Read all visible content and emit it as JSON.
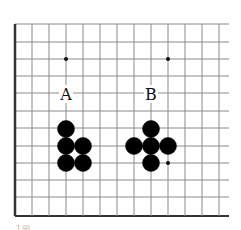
{
  "diagram": {
    "type": "go-board-fragment",
    "grid": {
      "columns_x": [
        15,
        32,
        49,
        66,
        83,
        100,
        117,
        134,
        151,
        168,
        185,
        202,
        219
      ],
      "rows_y": [
        24,
        42,
        59,
        76,
        93,
        111,
        128,
        146,
        163,
        180,
        197,
        216
      ],
      "line_right_end": 229,
      "left_edge_thick": true,
      "bottom_edge_thick": true,
      "line_color": "#8a8a8a",
      "edge_color": "#333333"
    },
    "star_points": [
      {
        "x": 66,
        "y": 59
      },
      {
        "x": 168,
        "y": 59
      },
      {
        "x": 168,
        "y": 163
      }
    ],
    "labels": [
      {
        "text": "A",
        "x": 66,
        "y": 94
      },
      {
        "text": "B",
        "x": 151,
        "y": 94
      }
    ],
    "stones": [
      {
        "color": "black",
        "group": "A",
        "x": 66,
        "y": 129
      },
      {
        "color": "black",
        "group": "A",
        "x": 66,
        "y": 146
      },
      {
        "color": "black",
        "group": "A",
        "x": 83,
        "y": 146
      },
      {
        "color": "black",
        "group": "A",
        "x": 66,
        "y": 163
      },
      {
        "color": "black",
        "group": "A",
        "x": 83,
        "y": 163
      },
      {
        "color": "black",
        "group": "B",
        "x": 151,
        "y": 129
      },
      {
        "color": "black",
        "group": "B",
        "x": 134,
        "y": 146
      },
      {
        "color": "black",
        "group": "B",
        "x": 151,
        "y": 146
      },
      {
        "color": "black",
        "group": "B",
        "x": 168,
        "y": 146
      },
      {
        "color": "black",
        "group": "B",
        "x": 151,
        "y": 163
      }
    ],
    "stone_radius": 8.5,
    "caption_fragment": "1図"
  }
}
